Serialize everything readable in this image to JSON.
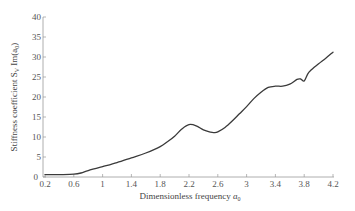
{
  "chart_data": {
    "type": "line",
    "title": "",
    "xlabel": "Dimensionless frequency a0",
    "ylabel": "Stiffness coefficient S_V, Im(a0)",
    "xlim": [
      0.2,
      4.2
    ],
    "ylim": [
      0,
      40
    ],
    "grid": false,
    "legend": null,
    "x_ticks": [
      "0.2",
      "0.6",
      "1",
      "1.4",
      "1.8",
      "2.2",
      "2.6",
      "3",
      "3.4",
      "3.8",
      "4.2"
    ],
    "y_ticks": [
      "0",
      "5",
      "10",
      "15",
      "20",
      "25",
      "30",
      "35",
      "40"
    ],
    "series": [
      {
        "name": "Stiffness coefficient",
        "x": [
          0.2,
          0.4,
          0.6,
          0.7,
          0.8,
          1.0,
          1.2,
          1.4,
          1.6,
          1.8,
          1.9,
          2.0,
          2.1,
          2.2,
          2.3,
          2.4,
          2.5,
          2.55,
          2.6,
          2.7,
          2.8,
          2.9,
          3.0,
          3.1,
          3.2,
          3.3,
          3.4,
          3.5,
          3.6,
          3.7,
          3.75,
          3.8,
          3.85,
          3.9,
          4.0,
          4.1,
          4.2
        ],
        "y": [
          0.6,
          0.6,
          0.7,
          1.0,
          1.6,
          2.6,
          3.6,
          4.8,
          6.0,
          7.6,
          8.8,
          10.2,
          12.0,
          13.1,
          12.8,
          11.8,
          11.2,
          11.1,
          11.3,
          12.4,
          14.0,
          15.8,
          17.6,
          19.6,
          21.2,
          22.4,
          22.7,
          22.7,
          23.2,
          24.4,
          24.5,
          24.0,
          25.8,
          26.8,
          28.3,
          29.7,
          31.2
        ]
      }
    ]
  },
  "labels": {
    "ylabel_main": "Stiffness coefficient S",
    "ylabel_sub": "V",
    "ylabel_rest": " Im(a",
    "ylabel_sub2": "0",
    "ylabel_end": ")",
    "xlabel_main": "Dimensionless frequency ",
    "xlabel_var": "a",
    "xlabel_sub": "0"
  },
  "colors": {
    "line": "#3a3a3a",
    "axis": "#888888",
    "text": "#555555"
  }
}
